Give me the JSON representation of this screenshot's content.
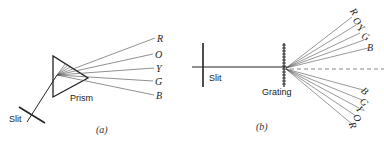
{
  "panel_a": {
    "caption": "(a)",
    "slit_label": "Slit",
    "prism_label": "Prism",
    "spectrum_labels": [
      "R",
      "O",
      "Y",
      "G",
      "B"
    ]
  },
  "panel_b": {
    "caption": "(b)",
    "slit_label": "Slit",
    "grating_label": "Grating",
    "upper_spectrum_labels": [
      "R",
      "O",
      "Y",
      "G",
      "B"
    ],
    "lower_spectrum_labels": [
      "B",
      "G",
      "Y",
      "O",
      "R"
    ]
  },
  "colors": {
    "line": "#222222",
    "background": "#ffffff"
  }
}
